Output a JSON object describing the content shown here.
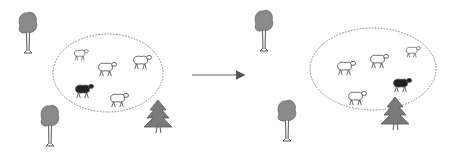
{
  "diagram": {
    "type": "illustration",
    "arrow": {
      "from": [
        192,
        75
      ],
      "to": [
        247,
        75
      ],
      "direction": "right"
    },
    "panels": [
      {
        "name": "before",
        "enclosure": {
          "cx": 108,
          "cy": 73,
          "rx": 55,
          "ry": 39
        },
        "sheep": [
          {
            "x": 80,
            "y": 54,
            "color": "white",
            "scale": 0.7
          },
          {
            "x": 106,
            "y": 68,
            "color": "white",
            "scale": 0.9
          },
          {
            "x": 141,
            "y": 61,
            "color": "white",
            "scale": 0.9
          },
          {
            "x": 83,
            "y": 90,
            "color": "black",
            "scale": 0.9
          },
          {
            "x": 118,
            "y": 99,
            "color": "white",
            "scale": 0.9
          }
        ],
        "trees": [
          {
            "kind": "deciduous",
            "x": 28,
            "y": 22
          },
          {
            "kind": "deciduous",
            "x": 50,
            "y": 115
          },
          {
            "kind": "pine",
            "x": 158,
            "y": 118
          }
        ]
      },
      {
        "name": "after",
        "enclosure": {
          "cx": 373,
          "cy": 69,
          "rx": 63,
          "ry": 41
        },
        "sheep": [
          {
            "x": 345,
            "y": 67,
            "color": "white",
            "scale": 0.9
          },
          {
            "x": 378,
            "y": 60,
            "color": "white",
            "scale": 0.9
          },
          {
            "x": 412,
            "y": 51,
            "color": "white",
            "scale": 0.7
          },
          {
            "x": 401,
            "y": 84,
            "color": "black",
            "scale": 0.9
          },
          {
            "x": 356,
            "y": 97,
            "color": "white",
            "scale": 0.9
          }
        ],
        "trees": [
          {
            "kind": "deciduous",
            "x": 264,
            "y": 20
          },
          {
            "kind": "deciduous",
            "x": 287,
            "y": 110
          },
          {
            "kind": "pine",
            "x": 395,
            "y": 115
          }
        ]
      }
    ]
  },
  "colors": {
    "line": "#555555",
    "foliage": "#8a8a8a",
    "pine": "#7a7a7a",
    "black_sheep": "#222222",
    "background": "#ffffff"
  }
}
